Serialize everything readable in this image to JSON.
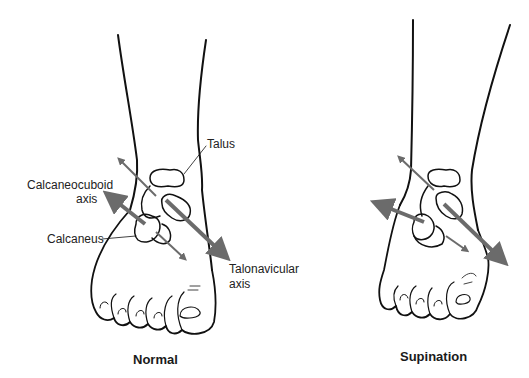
{
  "figure": {
    "panels": [
      {
        "id": "normal",
        "caption": "Normal",
        "labels": {
          "talus": "Talus",
          "calcaneocuboid_line1": "Calcaneocuboid",
          "calcaneocuboid_line2": "axis",
          "calcaneus": "Calcaneus",
          "talonavicular_line1": "Talonavicular",
          "talonavicular_line2": "axis"
        }
      },
      {
        "id": "supination",
        "caption": "Supination"
      }
    ],
    "colors": {
      "line": "#111111",
      "arrow": "#6b6b6b",
      "text": "#222222"
    }
  }
}
